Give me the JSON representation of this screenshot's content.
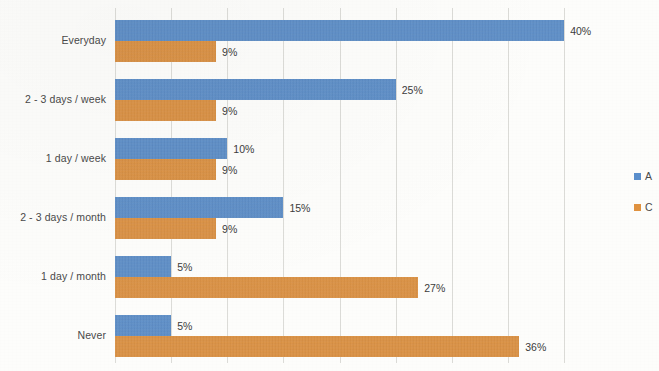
{
  "chart_data": {
    "type": "bar",
    "orientation": "horizontal",
    "title": "",
    "subtitle": "",
    "xlabel": "",
    "ylabel": "",
    "xlim": [
      0,
      45
    ],
    "grid": true,
    "gridline_interval": 5,
    "value_suffix": "%",
    "legend_position": "right",
    "categories": [
      "Everyday",
      "2 - 3 days / week",
      "1 day / week",
      "2 - 3 days / month",
      "1 day / month",
      "Never"
    ],
    "series": [
      {
        "name": "A",
        "color": "#5B8FCC",
        "values": [
          40,
          25,
          10,
          15,
          5,
          5
        ],
        "labels": [
          "40%",
          "25%",
          "10%",
          "15%",
          "5%",
          "5%"
        ]
      },
      {
        "name": "C",
        "color": "#E0923F",
        "values": [
          9,
          9,
          9,
          9,
          27,
          36
        ],
        "labels": [
          "9%",
          "9%",
          "9%",
          "9%",
          "27%",
          "36%"
        ]
      }
    ]
  },
  "legend": {
    "items": [
      {
        "label": "A",
        "color": "#5B8FCC"
      },
      {
        "label": "C",
        "color": "#E0923F"
      }
    ]
  },
  "colors": {
    "series_a": "#5B8FCC",
    "series_c": "#E0923F",
    "gridline": "#dcdcd8",
    "background": "#fdfdfb",
    "text": "#3a3a3a"
  }
}
